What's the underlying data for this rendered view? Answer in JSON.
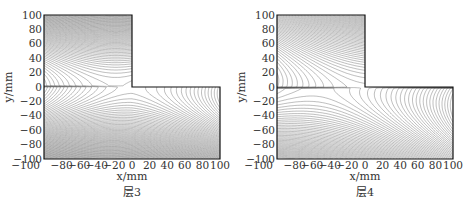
{
  "chart_data": [
    {
      "type": "contour",
      "title": "层3",
      "xlabel": "x/mm",
      "ylabel": "y/mm",
      "xlim": [
        -100,
        100
      ],
      "ylim": [
        -100,
        100
      ],
      "xticks": [
        "-100",
        "-80",
        "-60",
        "-40",
        "-20",
        "0",
        "20",
        "40",
        "60",
        "80",
        "100"
      ],
      "yticks": [
        "100",
        "80",
        "60",
        "40",
        "20",
        "0",
        "-20",
        "-40",
        "-60",
        "-80",
        "-100"
      ],
      "domain_shape": "L-shaped: full region x∈[-100,100], y∈[-100,0] plus x∈[-100,0], y∈[0,100]; notch at x>0,y>0 empty",
      "notch_corner": [
        0,
        0
      ],
      "description": "Dense grey contour lines; saddle near (-5,0) with contours opening leftward and downward; density increases toward top, bottom and left edges"
    },
    {
      "type": "contour",
      "title": "层4",
      "xlabel": "x/mm",
      "ylabel": "y/mm",
      "xlim": [
        -100,
        100
      ],
      "ylim": [
        -100,
        100
      ],
      "xticks": [
        "-100",
        "-80",
        "-60",
        "-40",
        "-20",
        "0",
        "20",
        "40",
        "60",
        "80",
        "100"
      ],
      "yticks": [
        "100",
        "80",
        "60",
        "40",
        "20",
        "0",
        "-20",
        "-40",
        "-60",
        "-80",
        "-100"
      ],
      "domain_shape": "L-shaped: full region x∈[-100,100], y∈[-100,0] plus x∈[-100,0], y∈[0,100]; notch at x>0,y>0 empty",
      "notch_corner": [
        0,
        0
      ],
      "description": "Dense grey contour lines; saddle near (-20,-5) with nested contours opening to the left edge; density greatest at top-left and bottom-right"
    }
  ],
  "panels": [
    {
      "caption": "层3",
      "xlabel": "x/mm",
      "ylabel": "y/mm"
    },
    {
      "caption": "层4",
      "xlabel": "x/mm",
      "ylabel": "y/mm"
    }
  ],
  "colors": {
    "contour": "#555555",
    "frame": "#111111",
    "text": "#333333"
  }
}
